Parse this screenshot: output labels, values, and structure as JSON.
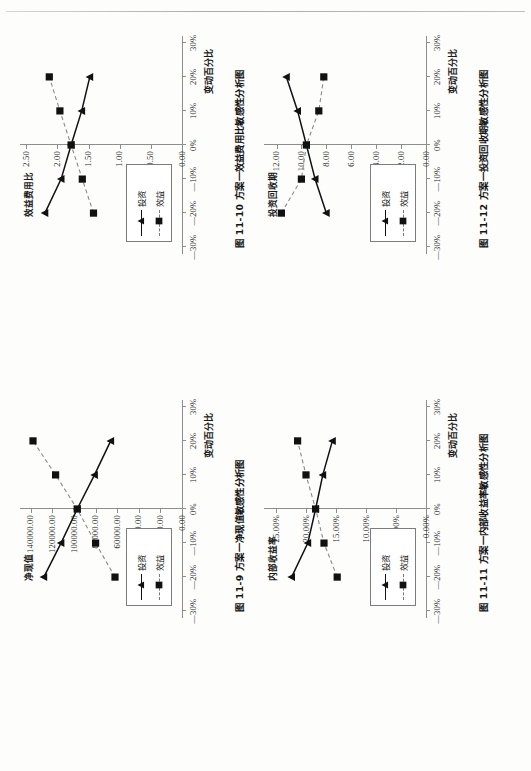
{
  "page": {
    "header_rule": true,
    "background_color": "#fdfdfc",
    "ink_color": "#1a1a1a",
    "axis_color": "#8e8e8e"
  },
  "legend_common": {
    "series": [
      {
        "label": "投资",
        "marker": "triangle",
        "line": "solid",
        "color": "#111111"
      },
      {
        "label": "效益",
        "marker": "square",
        "line": "dashed",
        "color": "#7a7a7a"
      }
    ]
  },
  "chart_data": [
    {
      "id": "fig-11-9",
      "type": "line",
      "title": "图 11-9  方案一净现值敏感性分析图",
      "caption_number": "图 11-9",
      "caption_text": "方案一净现值敏感性分析图",
      "xlabel": "变动百分比",
      "ylabel": "净现值",
      "x": [
        -20,
        -10,
        0,
        10,
        20
      ],
      "xticks": [
        -30,
        -20,
        -10,
        0,
        10,
        20,
        30
      ],
      "xticklabels": [
        "—30%",
        "—20%",
        "—10%",
        "0%",
        "10%",
        "20%",
        "30%"
      ],
      "yticks": [
        0,
        20000,
        40000,
        60000,
        80000,
        100000,
        120000,
        140000
      ],
      "yticklabels": [
        "0.00",
        "20000.00",
        "40000.00",
        "60000.00",
        "80000.00",
        "100000.00",
        "120000.00",
        "140000.00"
      ],
      "ylim": [
        0,
        150000
      ],
      "xlim": [
        -32,
        32
      ],
      "grid": false,
      "legend_position": "bottom-left",
      "series": [
        {
          "name": "投资",
          "marker": "triangle",
          "line": "solid",
          "values": [
            128000,
            112000,
            97000,
            81000,
            66000
          ]
        },
        {
          "name": "效益",
          "marker": "square",
          "line": "dashed",
          "values": [
            62000,
            80000,
            97000,
            117000,
            138000
          ]
        }
      ]
    },
    {
      "id": "fig-11-10",
      "type": "line",
      "title": "图 11-10  方案一效益费用比敏感性分析图",
      "caption_number": "图 11-10",
      "caption_text": "方案一效益费用比敏感性分析图",
      "xlabel": "变动百分比",
      "ylabel": "效益费用比",
      "x": [
        -20,
        -10,
        0,
        10,
        20
      ],
      "xticks": [
        -30,
        -20,
        -10,
        0,
        10,
        20,
        30
      ],
      "xticklabels": [
        "—30%",
        "—20%",
        "—10%",
        "0%",
        "10%",
        "20%",
        "30%"
      ],
      "yticks": [
        0.0,
        0.5,
        1.0,
        1.5,
        2.0,
        2.5
      ],
      "yticklabels": [
        "0.00",
        "0.50",
        "1.00",
        "1.50",
        "2.00",
        "2.50"
      ],
      "ylim": [
        0.0,
        2.6
      ],
      "xlim": [
        -32,
        32
      ],
      "grid": false,
      "legend_position": "bottom-left",
      "series": [
        {
          "name": "投资",
          "marker": "triangle",
          "line": "solid",
          "values": [
            2.2,
            1.94,
            1.78,
            1.61,
            1.48
          ]
        },
        {
          "name": "效益",
          "marker": "square",
          "line": "dashed",
          "values": [
            1.42,
            1.6,
            1.78,
            1.96,
            2.13
          ]
        }
      ]
    },
    {
      "id": "fig-11-11",
      "type": "line",
      "title": "图 11-11  方案一内部收益率敏感性分析图",
      "caption_number": "图 11-11",
      "caption_text": "方案一内部收益率敏感性分析图",
      "xlabel": "变动百分比",
      "ylabel": "内部收益率",
      "x": [
        -20,
        -10,
        0,
        10,
        20
      ],
      "xticks": [
        -30,
        -20,
        -10,
        0,
        10,
        20,
        30
      ],
      "xticklabels": [
        "—30%",
        "—20%",
        "—10%",
        "0%",
        "10%",
        "20%",
        "30%"
      ],
      "yticks": [
        0,
        5,
        10,
        15,
        20,
        25
      ],
      "yticklabels": [
        "0.00%",
        "5.00%",
        "10.00%",
        "15.00%",
        "20.00%",
        "25.00%"
      ],
      "ylim": [
        0,
        27
      ],
      "xlim": [
        -32,
        32
      ],
      "grid": false,
      "legend_position": "bottom-left",
      "series": [
        {
          "name": "投资",
          "marker": "triangle",
          "line": "solid",
          "values": [
            22.4,
            19.7,
            18.4,
            17.2,
            15.6
          ]
        },
        {
          "name": "效益",
          "marker": "square",
          "line": "dashed",
          "values": [
            14.8,
            17.0,
            18.4,
            20.0,
            21.4
          ]
        }
      ]
    },
    {
      "id": "fig-11-12",
      "type": "line",
      "title": "图 11-12  方案一投资回收期敏感性分析图",
      "caption_number": "图 11-12",
      "caption_text": "方案一投资回收期敏感性分析图",
      "xlabel": "变动百分比",
      "ylabel": "投资回收期",
      "x": [
        -20,
        -10,
        0,
        10,
        20
      ],
      "xticks": [
        -30,
        -20,
        -10,
        0,
        10,
        20,
        30
      ],
      "xticklabels": [
        "—30%",
        "—20%",
        "—10%",
        "0%",
        "10%",
        "20%",
        "30%"
      ],
      "yticks": [
        0,
        2,
        4,
        6,
        8,
        10,
        12
      ],
      "yticklabels": [
        "0.00",
        "2.00",
        "4.00",
        "6.00",
        "8.00",
        "10.00",
        "12.00"
      ],
      "ylim": [
        0,
        13
      ],
      "xlim": [
        -32,
        32
      ],
      "grid": false,
      "legend_position": "bottom-left",
      "series": [
        {
          "name": "投资",
          "marker": "triangle",
          "line": "solid",
          "values": [
            8.0,
            8.9,
            9.6,
            10.3,
            11.2
          ]
        },
        {
          "name": "效益",
          "marker": "square",
          "line": "dashed",
          "values": [
            11.6,
            10.0,
            9.6,
            8.6,
            8.2
          ]
        }
      ]
    }
  ]
}
